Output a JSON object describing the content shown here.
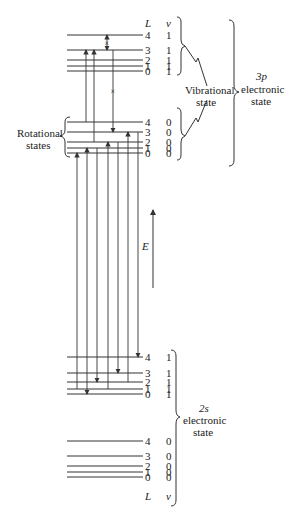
{
  "diagram": {
    "energy_axis_label": "E",
    "rotational_label_line1": "Rotational",
    "rotational_label_line2": "states",
    "vibrational_label_line1": "Vibrational",
    "vibrational_label_line2": "state",
    "upper_state_label_line1": "3p",
    "upper_state_label_line2": "electronic",
    "upper_state_label_line3": "state",
    "lower_state_label_line1": "2s",
    "lower_state_label_line2": "electronic",
    "lower_state_label_line3": "state",
    "column_header_L": "L",
    "column_header_v": "v",
    "groups": [
      {
        "id": "3p-v1",
        "electronic": "3p",
        "v": "1",
        "levels": [
          {
            "L": "4",
            "v": "1",
            "y": 35
          },
          {
            "L": "3",
            "v": "1",
            "y": 50
          },
          {
            "L": "2",
            "v": "1",
            "y": 60
          },
          {
            "L": "1",
            "v": "1",
            "y": 66
          },
          {
            "L": "0",
            "v": "1",
            "y": 71
          }
        ]
      },
      {
        "id": "3p-v0",
        "electronic": "3p",
        "v": "0",
        "levels": [
          {
            "L": "4",
            "v": "0",
            "y": 122
          },
          {
            "L": "3",
            "v": "0",
            "y": 132
          },
          {
            "L": "2",
            "v": "0",
            "y": 142
          },
          {
            "L": "1",
            "v": "0",
            "y": 148
          },
          {
            "L": "0",
            "v": "0",
            "y": 153
          }
        ]
      },
      {
        "id": "2s-v1",
        "electronic": "2s",
        "v": "1",
        "levels": [
          {
            "L": "4",
            "v": "1",
            "y": 357
          },
          {
            "L": "3",
            "v": "1",
            "y": 373
          },
          {
            "L": "2",
            "v": "1",
            "y": 382
          },
          {
            "L": "1",
            "v": "1",
            "y": 389
          },
          {
            "L": "0",
            "v": "1",
            "y": 394
          }
        ]
      },
      {
        "id": "2s-v0",
        "electronic": "2s",
        "v": "0",
        "levels": [
          {
            "L": "4",
            "v": "0",
            "y": 441
          },
          {
            "L": "3",
            "v": "0",
            "y": 456
          },
          {
            "L": "2",
            "v": "0",
            "y": 466
          },
          {
            "L": "1",
            "v": "0",
            "y": 472
          },
          {
            "L": "0",
            "v": "0",
            "y": 477
          }
        ]
      }
    ],
    "transitions_upper": [
      {
        "x": 86,
        "from_y": 122,
        "to_y": 50,
        "direction": "up"
      },
      {
        "x": 94,
        "from_y": 142,
        "to_y": 50,
        "direction": "down"
      },
      {
        "x": 113,
        "from_y": 50,
        "to_y": 132,
        "direction": "down",
        "forbidden": true
      },
      {
        "x": 107,
        "from_y": 35,
        "to_y": 50,
        "direction": "both",
        "forbidden": true
      }
    ],
    "transitions_main": [
      {
        "x": 77,
        "from_y": 389,
        "to_y": 153,
        "direction": "up"
      },
      {
        "x": 87,
        "from_y": 394,
        "to_y": 148,
        "direction": "both"
      },
      {
        "x": 97,
        "from_y": 148,
        "to_y": 382,
        "direction": "down"
      },
      {
        "x": 108,
        "from_y": 389,
        "to_y": 142,
        "direction": "up"
      },
      {
        "x": 118,
        "from_y": 142,
        "to_y": 373,
        "direction": "down"
      },
      {
        "x": 128,
        "from_y": 382,
        "to_y": 132,
        "direction": "up"
      },
      {
        "x": 138,
        "from_y": 132,
        "to_y": 357,
        "direction": "down"
      }
    ]
  }
}
